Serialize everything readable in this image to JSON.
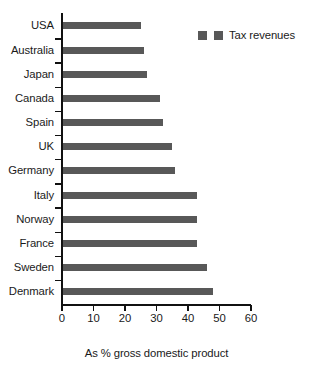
{
  "chart_data": {
    "type": "bar",
    "orientation": "horizontal",
    "title": "",
    "xlabel": "As % gross domestic product",
    "ylabel": "",
    "categories": [
      "USA",
      "Australia",
      "Japan",
      "Canada",
      "Spain",
      "UK",
      "Germany",
      "Italy",
      "Norway",
      "France",
      "Sweden",
      "Denmark"
    ],
    "series": [
      {
        "name": "Tax revenues",
        "values": [
          25,
          26,
          27,
          31,
          32,
          35,
          36,
          43,
          43,
          43,
          46,
          48
        ],
        "color": "#585858"
      }
    ],
    "xlim": [
      0,
      60
    ],
    "xticks": [
      0,
      10,
      20,
      30,
      40,
      50,
      60
    ],
    "xtick_labels": [
      "0",
      "10",
      "20",
      "30",
      "40",
      "50",
      "60"
    ],
    "grid": false,
    "legend": {
      "position": "top-right",
      "entries": [
        "Tax revenues"
      ],
      "swatch_count": 2
    }
  },
  "legend": {
    "label": "Tax revenues"
  },
  "axis": {
    "x_title": "As % gross domestic product"
  }
}
